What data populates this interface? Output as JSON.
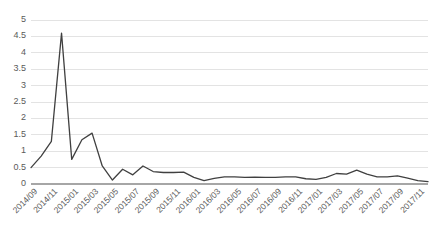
{
  "chart_data": {
    "type": "line",
    "title": "",
    "subtitle": "",
    "xlabel": "",
    "ylabel": "",
    "grid": true,
    "legend": false,
    "legend_position": "none",
    "line_color": "#404040",
    "grid_color": "#e3e3e3",
    "axis_color": "#a6a6a6",
    "ylim": [
      0,
      5
    ],
    "yticks": [
      "0",
      "0.5",
      "1",
      "1.5",
      "2",
      "2.5",
      "3",
      "3.5",
      "4",
      "4.5",
      "5"
    ],
    "ytick_values": [
      0,
      0.5,
      1,
      1.5,
      2,
      2.5,
      3,
      3.5,
      4,
      4.5,
      5
    ],
    "xticks": [
      "2014/09",
      "2014/11",
      "2015/01",
      "2015/03",
      "2015/05",
      "2015/07",
      "2015/09",
      "2015/11",
      "2016/01",
      "2016/03",
      "2016/05",
      "2016/07",
      "2016/09",
      "2016/11",
      "2017/01",
      "2017/03",
      "2017/05",
      "2017/07",
      "2017/09",
      "2017/11"
    ],
    "x": [
      "2014/09",
      "2014/10",
      "2014/11",
      "2014/12",
      "2015/01",
      "2015/02",
      "2015/03",
      "2015/04",
      "2015/05",
      "2015/06",
      "2015/07",
      "2015/08",
      "2015/09",
      "2015/10",
      "2015/11",
      "2015/12",
      "2016/01",
      "2016/02",
      "2016/03",
      "2016/04",
      "2016/05",
      "2016/06",
      "2016/07",
      "2016/08",
      "2016/09",
      "2016/10",
      "2016/11",
      "2016/12",
      "2017/01",
      "2017/02",
      "2017/03",
      "2017/04",
      "2017/05",
      "2017/06",
      "2017/07",
      "2017/08",
      "2017/09",
      "2017/10",
      "2017/11",
      "2017/12"
    ],
    "values": [
      0.5,
      0.85,
      1.3,
      4.6,
      0.75,
      1.35,
      1.55,
      0.55,
      0.12,
      0.45,
      0.28,
      0.55,
      0.38,
      0.35,
      0.35,
      0.36,
      0.2,
      0.1,
      0.17,
      0.22,
      0.22,
      0.2,
      0.21,
      0.2,
      0.2,
      0.22,
      0.22,
      0.16,
      0.14,
      0.2,
      0.32,
      0.3,
      0.42,
      0.3,
      0.22,
      0.22,
      0.25,
      0.18,
      0.1,
      0.07
    ]
  }
}
